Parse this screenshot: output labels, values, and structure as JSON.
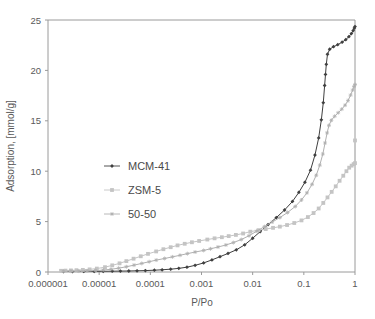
{
  "chart_data": {
    "type": "line",
    "title": "",
    "xlabel": "P/Po",
    "ylabel": "Adsorption, [mmol/g]",
    "xscale": "log",
    "yscale": "linear",
    "xlim": [
      1e-06,
      1
    ],
    "ylim": [
      0,
      25
    ],
    "xticks": [
      1e-06,
      1e-05,
      0.0001,
      0.001,
      0.01,
      0.1,
      1
    ],
    "xtick_labels": [
      "0.000001",
      "0.00001",
      "0.0001",
      "0.001",
      "0.01",
      "0.1",
      "1"
    ],
    "yticks": [
      0,
      5,
      10,
      15,
      20,
      25
    ],
    "ytick_labels": [
      "0",
      "5",
      "10",
      "15",
      "20",
      "25"
    ],
    "grid": false,
    "legend_position": "center-left",
    "series": [
      {
        "name": "MCM-41",
        "color": "#404040",
        "marker": "diamond",
        "points": [
          [
            2e-06,
            0.05
          ],
          [
            3e-06,
            0.05
          ],
          [
            5e-06,
            0.06
          ],
          [
            8e-06,
            0.06
          ],
          [
            1.2e-05,
            0.07
          ],
          [
            1.8e-05,
            0.08
          ],
          [
            2.6e-05,
            0.09
          ],
          [
            3.8e-05,
            0.1
          ],
          [
            5.5e-05,
            0.12
          ],
          [
            8e-05,
            0.14
          ],
          [
            0.00012,
            0.18
          ],
          [
            0.00017,
            0.22
          ],
          [
            0.00025,
            0.28
          ],
          [
            0.00036,
            0.36
          ],
          [
            0.00052,
            0.48
          ],
          [
            0.00075,
            0.66
          ],
          [
            0.0011,
            0.9
          ],
          [
            0.0016,
            1.2
          ],
          [
            0.0023,
            1.52
          ],
          [
            0.0033,
            1.84
          ],
          [
            0.0048,
            2.2
          ],
          [
            0.007,
            2.7
          ],
          [
            0.01,
            3.35
          ],
          [
            0.014,
            4.0
          ],
          [
            0.02,
            4.7
          ],
          [
            0.029,
            5.4
          ],
          [
            0.042,
            6.15
          ],
          [
            0.06,
            7.0
          ],
          [
            0.08,
            7.9
          ],
          [
            0.105,
            8.9
          ],
          [
            0.135,
            10.1
          ],
          [
            0.165,
            11.6
          ],
          [
            0.195,
            13.3
          ],
          [
            0.22,
            15.1
          ],
          [
            0.24,
            16.8
          ],
          [
            0.255,
            18.5
          ],
          [
            0.265,
            19.6
          ],
          [
            0.275,
            20.6
          ],
          [
            0.29,
            21.6
          ],
          [
            0.32,
            22.1
          ],
          [
            0.38,
            22.35
          ],
          [
            0.46,
            22.55
          ],
          [
            0.56,
            22.8
          ],
          [
            0.66,
            23.05
          ],
          [
            0.76,
            23.35
          ],
          [
            0.85,
            23.65
          ],
          [
            0.92,
            23.95
          ],
          [
            0.97,
            24.2
          ],
          [
            1.0,
            24.35
          ]
        ]
      },
      {
        "name": "ZSM-5",
        "color": "#c4c4c4",
        "marker": "square",
        "points": [
          [
            1.8e-06,
            0.12
          ],
          [
            2.2e-06,
            0.14
          ],
          [
            2.8e-06,
            0.16
          ],
          [
            3.6e-06,
            0.18
          ],
          [
            4.8e-06,
            0.21
          ],
          [
            6.5e-06,
            0.26
          ],
          [
            9e-06,
            0.34
          ],
          [
            1.3e-05,
            0.48
          ],
          [
            1.8e-05,
            0.66
          ],
          [
            2.5e-05,
            0.86
          ],
          [
            3.4e-05,
            1.08
          ],
          [
            4.7e-05,
            1.32
          ],
          [
            6.5e-05,
            1.56
          ],
          [
            9e-05,
            1.8
          ],
          [
            0.00013,
            2.04
          ],
          [
            0.00018,
            2.26
          ],
          [
            0.00025,
            2.46
          ],
          [
            0.00034,
            2.64
          ],
          [
            0.00047,
            2.8
          ],
          [
            0.00065,
            2.95
          ],
          [
            0.0009,
            3.08
          ],
          [
            0.0013,
            3.22
          ],
          [
            0.0018,
            3.34
          ],
          [
            0.0025,
            3.45
          ],
          [
            0.0034,
            3.56
          ],
          [
            0.0047,
            3.68
          ],
          [
            0.0065,
            3.82
          ],
          [
            0.009,
            4.0
          ],
          [
            0.013,
            4.15
          ],
          [
            0.018,
            4.26
          ],
          [
            0.025,
            4.38
          ],
          [
            0.034,
            4.5
          ],
          [
            0.047,
            4.66
          ],
          [
            0.065,
            4.86
          ],
          [
            0.09,
            5.12
          ],
          [
            0.12,
            5.45
          ],
          [
            0.155,
            5.85
          ],
          [
            0.195,
            6.3
          ],
          [
            0.24,
            6.85
          ],
          [
            0.29,
            7.4
          ],
          [
            0.35,
            7.95
          ],
          [
            0.42,
            8.5
          ],
          [
            0.5,
            9.05
          ],
          [
            0.59,
            9.55
          ],
          [
            0.68,
            10.0
          ],
          [
            0.77,
            10.35
          ],
          [
            0.86,
            10.55
          ],
          [
            0.94,
            10.7
          ],
          [
            1.0,
            10.8
          ],
          [
            1.0,
            13.05
          ]
        ]
      },
      {
        "name": "50-50",
        "color": "#b0b0b0",
        "marker": "star",
        "points": [
          [
            2e-06,
            0.07
          ],
          [
            2.8e-06,
            0.08
          ],
          [
            4e-06,
            0.09
          ],
          [
            5.8e-06,
            0.11
          ],
          [
            8.5e-06,
            0.14
          ],
          [
            1.2e-05,
            0.19
          ],
          [
            1.7e-05,
            0.27
          ],
          [
            2.4e-05,
            0.38
          ],
          [
            3.4e-05,
            0.52
          ],
          [
            4.8e-05,
            0.68
          ],
          [
            6.8e-05,
            0.85
          ],
          [
            9.5e-05,
            1.02
          ],
          [
            0.00013,
            1.18
          ],
          [
            0.00019,
            1.34
          ],
          [
            0.00027,
            1.5
          ],
          [
            0.00038,
            1.66
          ],
          [
            0.00053,
            1.82
          ],
          [
            0.00075,
            1.98
          ],
          [
            0.0011,
            2.14
          ],
          [
            0.0015,
            2.3
          ],
          [
            0.0021,
            2.48
          ],
          [
            0.003,
            2.68
          ],
          [
            0.0042,
            2.92
          ],
          [
            0.006,
            3.22
          ],
          [
            0.0085,
            3.6
          ],
          [
            0.012,
            4.05
          ],
          [
            0.017,
            4.5
          ],
          [
            0.024,
            4.95
          ],
          [
            0.034,
            5.4
          ],
          [
            0.048,
            5.9
          ],
          [
            0.068,
            6.5
          ],
          [
            0.09,
            7.15
          ],
          [
            0.115,
            7.85
          ],
          [
            0.145,
            8.7
          ],
          [
            0.175,
            9.6
          ],
          [
            0.205,
            10.6
          ],
          [
            0.235,
            11.7
          ],
          [
            0.26,
            12.8
          ],
          [
            0.285,
            13.8
          ],
          [
            0.31,
            14.55
          ],
          [
            0.345,
            15.05
          ],
          [
            0.4,
            15.45
          ],
          [
            0.47,
            15.8
          ],
          [
            0.55,
            16.15
          ],
          [
            0.64,
            16.55
          ],
          [
            0.73,
            17.0
          ],
          [
            0.82,
            17.55
          ],
          [
            0.9,
            18.05
          ],
          [
            0.96,
            18.4
          ],
          [
            1.0,
            18.6
          ]
        ]
      }
    ],
    "legend": [
      {
        "label": "MCM-41",
        "color": "#404040",
        "marker": "diamond"
      },
      {
        "label": "ZSM-5",
        "color": "#c4c4c4",
        "marker": "square"
      },
      {
        "label": "50-50",
        "color": "#b0b0b0",
        "marker": "star"
      }
    ]
  },
  "colors": {
    "background": "#ffffff",
    "axis": "#9a9a9a",
    "text": "#595959",
    "mcm41": "#404040",
    "zsm5": "#c4c4c4",
    "fifty_fifty": "#b0b0b0"
  }
}
